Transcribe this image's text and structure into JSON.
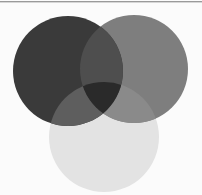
{
  "diagram": {
    "type": "venn",
    "sets": 3,
    "background": "#fbfbfb",
    "top_rule_color": "#9a9a9a",
    "circles": [
      {
        "id": "A",
        "name": "circle-top-left",
        "cx": 68,
        "cy": 71,
        "r": 55,
        "color": "#3a3a3a"
      },
      {
        "id": "B",
        "name": "circle-top-right",
        "cx": 134,
        "cy": 69,
        "r": 54,
        "color": "#7e7e7e"
      },
      {
        "id": "C",
        "name": "circle-bottom",
        "cx": 104,
        "cy": 137,
        "r": 55,
        "color": "#e3e3e3"
      }
    ],
    "regions": {
      "A_only": "#3a3a3a",
      "B_only": "#7e7e7e",
      "C_only": "#e3e3e3",
      "A_and_B": "#4e4e4e",
      "A_and_C": "#5e5e5e",
      "B_and_C": "#8a8a8a",
      "A_and_B_and_C": "#2a2a2a"
    },
    "labels": []
  }
}
